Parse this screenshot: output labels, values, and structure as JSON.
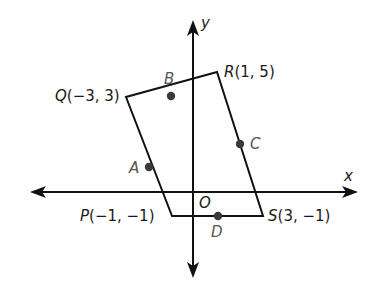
{
  "diagram": {
    "type": "coordinate-plane-quadrilateral",
    "axes": {
      "x_label": "x",
      "y_label": "y",
      "origin_label": "O"
    },
    "vertices": [
      {
        "name": "P",
        "label": "P(−1, −1)",
        "x": -1,
        "y": -1
      },
      {
        "name": "Q",
        "label": "Q(−3, 3)",
        "x": -3,
        "y": 3
      },
      {
        "name": "R",
        "label": "R(1, 5)",
        "x": 1,
        "y": 5
      },
      {
        "name": "S",
        "label": "S(3, −1)",
        "x": 3,
        "y": -1
      }
    ],
    "midpoints": [
      {
        "name": "A",
        "label": "A",
        "segment": "PQ"
      },
      {
        "name": "B",
        "label": "B",
        "segment": "QR"
      },
      {
        "name": "C",
        "label": "C",
        "segment": "RS"
      },
      {
        "name": "D",
        "label": "D",
        "segment": "SP"
      }
    ],
    "colors": {
      "line": "#111111",
      "point": "#3a3a3a",
      "midpoint_label": "#555555"
    }
  }
}
